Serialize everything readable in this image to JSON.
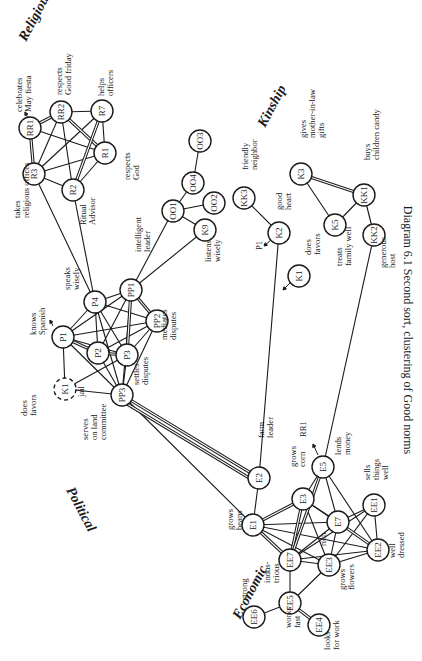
{
  "caption": "Diagram 6.1 Second sort, clustering of Good norms",
  "clusters": [
    {
      "name": "Religious",
      "x": 26,
      "y": 42,
      "rot": -62
    },
    {
      "name": "Kinship",
      "x": 265,
      "y": 128,
      "rot": -62
    },
    {
      "name": "Political",
      "x": 66,
      "y": 490,
      "rot": 62
    },
    {
      "name": "Economic",
      "x": 240,
      "y": 620,
      "rot": -62
    }
  ],
  "nodes": [
    {
      "id": "RR1",
      "x": 30,
      "y": 128,
      "dashed": false
    },
    {
      "id": "RR2",
      "x": 61,
      "y": 112,
      "dashed": false
    },
    {
      "id": "R7",
      "x": 102,
      "y": 111,
      "dashed": false
    },
    {
      "id": "R1",
      "x": 105,
      "y": 153,
      "dashed": false
    },
    {
      "id": "R3",
      "x": 34,
      "y": 174,
      "dashed": false
    },
    {
      "id": "R2",
      "x": 73,
      "y": 190,
      "dashed": false
    },
    {
      "id": "OO3",
      "x": 200,
      "y": 141,
      "dashed": false
    },
    {
      "id": "OO4",
      "x": 193,
      "y": 183,
      "dashed": false
    },
    {
      "id": "OO2",
      "x": 214,
      "y": 203,
      "dashed": false
    },
    {
      "id": "OO1",
      "x": 173,
      "y": 211,
      "dashed": false
    },
    {
      "id": "K9",
      "x": 205,
      "y": 230,
      "dashed": false
    },
    {
      "id": "KK3",
      "x": 244,
      "y": 198,
      "dashed": false
    },
    {
      "id": "K2",
      "x": 279,
      "y": 233,
      "dashed": false
    },
    {
      "id": "K1",
      "x": 299,
      "y": 276,
      "dashed": false
    },
    {
      "id": "K3",
      "x": 301,
      "y": 174,
      "dashed": false
    },
    {
      "id": "KK1",
      "x": 364,
      "y": 195,
      "dashed": false
    },
    {
      "id": "K5",
      "x": 335,
      "y": 225,
      "dashed": false
    },
    {
      "id": "KK2",
      "x": 374,
      "y": 235,
      "dashed": false
    },
    {
      "id": "PP1",
      "x": 131,
      "y": 290,
      "dashed": false
    },
    {
      "id": "P4",
      "x": 95,
      "y": 302,
      "dashed": false
    },
    {
      "id": "PP2",
      "x": 157,
      "y": 321,
      "dashed": false
    },
    {
      "id": "P1",
      "x": 63,
      "y": 337,
      "dashed": false
    },
    {
      "id": "P2",
      "x": 98,
      "y": 353,
      "dashed": false
    },
    {
      "id": "P3",
      "x": 127,
      "y": 355,
      "dashed": false
    },
    {
      "id": "K1p",
      "label": "K1",
      "x": 65,
      "y": 389,
      "dashed": true
    },
    {
      "id": "PP3",
      "x": 122,
      "y": 395,
      "dashed": false
    },
    {
      "id": "E2",
      "x": 259,
      "y": 478,
      "dashed": false
    },
    {
      "id": "E5",
      "x": 323,
      "y": 467,
      "dashed": false
    },
    {
      "id": "E3",
      "x": 303,
      "y": 499,
      "dashed": false
    },
    {
      "id": "E1",
      "x": 253,
      "y": 525,
      "dashed": false
    },
    {
      "id": "E7",
      "x": 338,
      "y": 522,
      "dashed": false
    },
    {
      "id": "EE1",
      "x": 374,
      "y": 505,
      "dashed": false
    },
    {
      "id": "EE7",
      "x": 290,
      "y": 560,
      "dashed": false
    },
    {
      "id": "EE2",
      "x": 378,
      "y": 550,
      "dashed": false
    },
    {
      "id": "EE3",
      "x": 329,
      "y": 565,
      "dashed": false
    },
    {
      "id": "EE5",
      "x": 290,
      "y": 603,
      "dashed": false
    },
    {
      "id": "EE6",
      "x": 254,
      "y": 617,
      "dashed": false
    },
    {
      "id": "EE4",
      "x": 319,
      "y": 625,
      "dashed": false
    }
  ],
  "labels": [
    {
      "text": [
        "celebrates",
        "May fiesta"
      ],
      "x": 22,
      "y": 112
    },
    {
      "text": [
        "respects",
        "Good friday"
      ],
      "x": 62,
      "y": 95
    },
    {
      "text": [
        "helps",
        "officers"
      ],
      "x": 104,
      "y": 96
    },
    {
      "text": [
        "respects",
        "God"
      ],
      "x": 130,
      "y": 180
    },
    {
      "text": [
        "takes",
        "religious offices"
      ],
      "x": 20,
      "y": 218
    },
    {
      "text": [
        "Ritual",
        "Advisor"
      ],
      "x": 86,
      "y": 225
    },
    {
      "text": [
        "friendly",
        "neighbor"
      ],
      "x": 248,
      "y": 170
    },
    {
      "text": [
        "gives",
        "mother-in-law",
        "gifts"
      ],
      "x": 306,
      "y": 138
    },
    {
      "text": [
        "buys",
        "children candy"
      ],
      "x": 370,
      "y": 160
    },
    {
      "text": [
        "good",
        "heart"
      ],
      "x": 282,
      "y": 210
    },
    {
      "text": [
        "P1"
      ],
      "x": 262,
      "y": 250
    },
    {
      "text": [
        "does",
        "favors"
      ],
      "x": 311,
      "y": 255
    },
    {
      "text": [
        "treats",
        "family well"
      ],
      "x": 342,
      "y": 266
    },
    {
      "text": [
        "generous",
        "host"
      ],
      "x": 386,
      "y": 268
    },
    {
      "text": [
        "listens",
        "wisely"
      ],
      "x": 211,
      "y": 262
    },
    {
      "text": [
        "intelligent",
        "leader"
      ],
      "x": 141,
      "y": 252
    },
    {
      "text": [
        "speaks",
        "wisely"
      ],
      "x": 70,
      "y": 290
    },
    {
      "text": [
        "mediates",
        "disputes"
      ],
      "x": 167,
      "y": 340
    },
    {
      "text": [
        "knows",
        "Spanish"
      ],
      "x": 36,
      "y": 335
    },
    {
      "text": [
        "settles",
        "disputes"
      ],
      "x": 139,
      "y": 385
    },
    {
      "text": [
        "jail"
      ],
      "x": 84,
      "y": 397
    },
    {
      "text": [
        "does",
        "favors"
      ],
      "x": 27,
      "y": 416
    },
    {
      "text": [
        "serves",
        "on land",
        "committee"
      ],
      "x": 88,
      "y": 440
    },
    {
      "text": [
        "farm",
        "leader"
      ],
      "x": 264,
      "y": 438
    },
    {
      "text": [
        "RR1"
      ],
      "x": 306,
      "y": 437
    },
    {
      "text": [
        "lends",
        "money"
      ],
      "x": 341,
      "y": 455
    },
    {
      "text": [
        "grows",
        "corn"
      ],
      "x": 296,
      "y": 467
    },
    {
      "text": [
        "sells",
        "things",
        "well"
      ],
      "x": 370,
      "y": 480
    },
    {
      "text": [
        "grows",
        "beans"
      ],
      "x": 233,
      "y": 530
    },
    {
      "text": [
        "rich"
      ],
      "x": 326,
      "y": 546
    },
    {
      "text": [
        "well",
        "dressed"
      ],
      "x": 395,
      "y": 558
    },
    {
      "text": [
        "indus-",
        "trious"
      ],
      "x": 270,
      "y": 583
    },
    {
      "text": [
        "grows",
        "flowers"
      ],
      "x": 345,
      "y": 590
    },
    {
      "text": [
        "strong"
      ],
      "x": 247,
      "y": 600
    },
    {
      "text": [
        "works",
        "fast"
      ],
      "x": 291,
      "y": 628
    },
    {
      "text": [
        "looks",
        "for work"
      ],
      "x": 330,
      "y": 650
    }
  ],
  "edges": {
    "single": [
      [
        "RR1",
        "R1"
      ],
      [
        "RR2",
        "R7"
      ],
      [
        "RR2",
        "R2"
      ],
      [
        "R7",
        "R3"
      ],
      [
        "R7",
        "R1"
      ],
      [
        "R3",
        "R1"
      ],
      [
        "R3",
        "R2"
      ],
      [
        "R3",
        "RR2"
      ],
      [
        "R2",
        "R1"
      ],
      [
        "R3",
        "P4"
      ],
      [
        "R2",
        "P4"
      ],
      [
        "OO3",
        "OO4"
      ],
      [
        "OO4",
        "OO1"
      ],
      [
        "OO1",
        "OO2"
      ],
      [
        "OO1",
        "K9"
      ],
      [
        "OO1",
        "PP1"
      ],
      [
        "K9",
        "PP1"
      ],
      [
        "KK3",
        "K2"
      ],
      [
        "K3",
        "K5"
      ],
      [
        "K5",
        "KK1"
      ],
      [
        "KK1",
        "KK2"
      ],
      [
        "PP1",
        "P4"
      ],
      [
        "PP1",
        "P1"
      ],
      [
        "PP1",
        "P2"
      ],
      [
        "PP1",
        "PP3"
      ],
      [
        "P4",
        "PP2"
      ],
      [
        "P4",
        "P2"
      ],
      [
        "P4",
        "P3"
      ],
      [
        "P4",
        "PP3"
      ],
      [
        "P1",
        "PP2"
      ],
      [
        "P1",
        "P3"
      ],
      [
        "P1",
        "K1p"
      ],
      [
        "P1",
        "PP3"
      ],
      [
        "P2",
        "PP3"
      ],
      [
        "P2",
        "PP2"
      ],
      [
        "PP2",
        "P3"
      ],
      [
        "PP2",
        "PP3"
      ],
      [
        "P3",
        "PP3"
      ],
      [
        "P3",
        "K1p"
      ],
      [
        "K1p",
        "PP3"
      ],
      [
        "P1",
        "P4"
      ],
      [
        "PP3",
        "E1"
      ],
      [
        "K2",
        "E2"
      ],
      [
        "KK2",
        "E5"
      ],
      [
        "E2",
        "E1"
      ],
      [
        "E5",
        "E3"
      ],
      [
        "E5",
        "E7"
      ],
      [
        "E5",
        "EE2"
      ],
      [
        "E3",
        "E7"
      ],
      [
        "E3",
        "EE2"
      ],
      [
        "E3",
        "EE3"
      ],
      [
        "E1",
        "E7"
      ],
      [
        "E1",
        "EE3"
      ],
      [
        "E1",
        "EE2"
      ],
      [
        "E7",
        "EE1"
      ],
      [
        "E7",
        "EE3"
      ],
      [
        "E7",
        "EE7"
      ],
      [
        "EE1",
        "EE2"
      ],
      [
        "EE1",
        "EE7"
      ],
      [
        "EE1",
        "EE3"
      ],
      [
        "EE7",
        "EE3"
      ],
      [
        "EE7",
        "EE2"
      ],
      [
        "EE7",
        "EE5"
      ],
      [
        "EE3",
        "EE5"
      ],
      [
        "EE3",
        "EE2"
      ],
      [
        "EE5",
        "EE6"
      ]
    ],
    "double": [
      [
        "RR1",
        "RR2"
      ],
      [
        "RR1",
        "R3"
      ],
      [
        "RR2",
        "R1"
      ],
      [
        "R7",
        "R2"
      ],
      [
        "K3",
        "KK1"
      ],
      [
        "PP1",
        "P3"
      ],
      [
        "PP1",
        "PP2"
      ],
      [
        "P1",
        "P2"
      ],
      [
        "P2",
        "P3"
      ],
      [
        "PP3",
        "E2"
      ],
      [
        "PP3",
        "E2b"
      ],
      [
        "E1",
        "E3"
      ],
      [
        "E1",
        "EE7"
      ],
      [
        "E3",
        "EE7"
      ],
      [
        "E5",
        "EE7"
      ],
      [
        "E7",
        "EE2"
      ],
      [
        "EE5",
        "EE4"
      ]
    ]
  },
  "arrows": [
    {
      "from": [
        271,
        240
      ],
      "to": [
        264,
        246
      ]
    },
    {
      "from": [
        290,
        283
      ],
      "to": [
        283,
        290
      ]
    },
    {
      "from": [
        318,
        455
      ],
      "to": [
        313,
        444
      ]
    },
    {
      "from": [
        28,
        118
      ],
      "to": [
        25,
        112
      ]
    },
    {
      "from": [
        53,
        326
      ],
      "to": [
        50,
        320
      ]
    }
  ],
  "node_radius": 11
}
